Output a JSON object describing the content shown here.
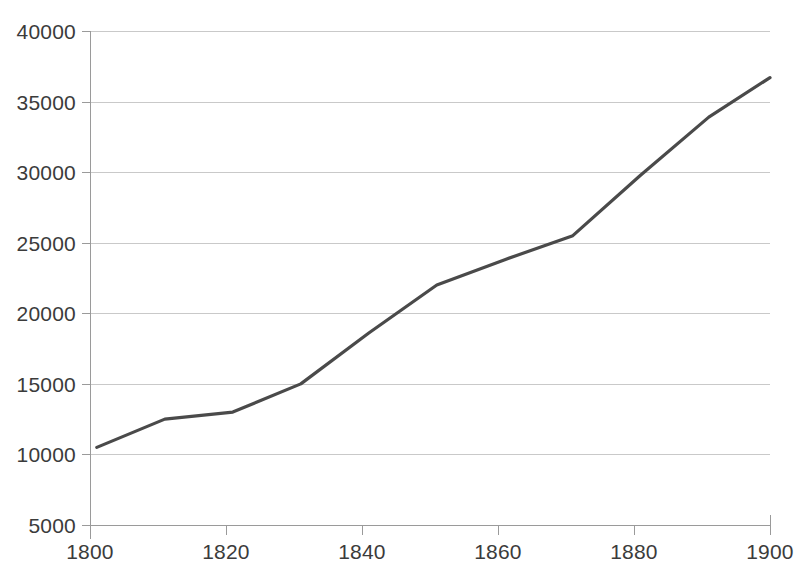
{
  "chart_data": {
    "type": "line",
    "title": "",
    "subtitle": "",
    "xlabel": "",
    "ylabel": "",
    "xlim": [
      1800,
      1900
    ],
    "ylim": [
      5000,
      40000
    ],
    "grid": true,
    "legend": false,
    "legend_position": "none",
    "x_tick_labels": [
      "1800",
      "1820",
      "1840",
      "1860",
      "1880",
      "1900"
    ],
    "x_ticks": [
      1800,
      1820,
      1840,
      1860,
      1880,
      1900
    ],
    "y_tick_labels": [
      "5000",
      "10000",
      "15000",
      "20000",
      "25000",
      "30000",
      "35000",
      "40000"
    ],
    "y_ticks": [
      5000,
      10000,
      15000,
      20000,
      25000,
      30000,
      35000,
      40000
    ],
    "series": [
      {
        "name": "",
        "color": "#4a4a4a",
        "x": [
          1801,
          1811,
          1821,
          1831,
          1841,
          1851,
          1861,
          1871,
          1881,
          1891,
          1900
        ],
        "values": [
          10500,
          12500,
          13000,
          15000,
          18600,
          22000,
          23800,
          25500,
          29800,
          33900,
          36700
        ]
      }
    ]
  },
  "colors": {
    "line": "#4a4a4a",
    "grid": "#c9c9c9",
    "axis": "#9a9a9a",
    "text": "#3b3b3b",
    "background": "#ffffff"
  }
}
